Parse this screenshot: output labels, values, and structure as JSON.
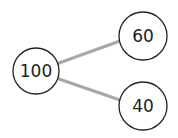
{
  "diagram": {
    "type": "number-bond",
    "whole": {
      "label": "100",
      "cx": 36,
      "cy": 71,
      "r": 23
    },
    "parts": [
      {
        "label": "60",
        "cx": 143,
        "cy": 36,
        "r": 24
      },
      {
        "label": "40",
        "cx": 143,
        "cy": 106,
        "r": 24
      }
    ],
    "colors": {
      "connector": "#a8a8a8",
      "circle_stroke": "#222222",
      "text": "#222222"
    }
  }
}
